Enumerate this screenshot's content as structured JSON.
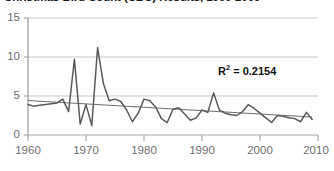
{
  "chart_data": {
    "type": "line",
    "title": "Christmas Bird Count (CBC) Results, 1960-2009",
    "xlabel": "",
    "ylabel": "",
    "xlim": [
      1960,
      2010
    ],
    "ylim": [
      0,
      15
    ],
    "grid": true,
    "legend": false,
    "yticks": [
      "0",
      "5",
      "10",
      "15"
    ],
    "ytick_values": [
      0,
      5,
      10,
      15
    ],
    "xticks": [
      "1960",
      "1970",
      "1980",
      "1990",
      "2000",
      "2010"
    ],
    "xtick_values": [
      1960,
      1970,
      1980,
      1990,
      2000,
      2010
    ],
    "annotations": [
      {
        "text": "R² = 0.2154",
        "label": "R",
        "sup": "2",
        "rest": " = 0.2154"
      }
    ],
    "series": [
      {
        "name": "CBC count",
        "color": "#5a5a5a",
        "x": [
          1960,
          1961,
          1962,
          1963,
          1964,
          1965,
          1966,
          1967,
          1968,
          1969,
          1970,
          1971,
          1972,
          1973,
          1974,
          1975,
          1976,
          1977,
          1978,
          1979,
          1980,
          1981,
          1982,
          1983,
          1984,
          1985,
          1986,
          1987,
          1988,
          1989,
          1990,
          1991,
          1992,
          1993,
          1994,
          1995,
          1996,
          1997,
          1998,
          1999,
          2000,
          2001,
          2002,
          2003,
          2004,
          2005,
          2006,
          2007,
          2008,
          2009
        ],
        "values": [
          3.9,
          3.7,
          3.8,
          3.9,
          4.0,
          4.1,
          4.6,
          3.0,
          9.7,
          1.4,
          3.9,
          1.2,
          11.2,
          6.6,
          4.4,
          4.6,
          4.3,
          3.2,
          1.7,
          2.8,
          4.6,
          4.4,
          3.6,
          2.1,
          1.6,
          3.3,
          3.5,
          2.7,
          1.9,
          2.2,
          3.2,
          2.9,
          5.4,
          3.2,
          2.8,
          2.6,
          2.5,
          3.0,
          3.9,
          3.4,
          2.8,
          2.2,
          1.6,
          2.5,
          2.4,
          2.2,
          2.1,
          1.7,
          2.9,
          2.0
        ]
      },
      {
        "name": "Linear trendline",
        "color": "#6e6e6e",
        "trend": true,
        "x": [
          1960,
          2009
        ],
        "values": [
          4.42,
          2.3
        ]
      }
    ]
  }
}
